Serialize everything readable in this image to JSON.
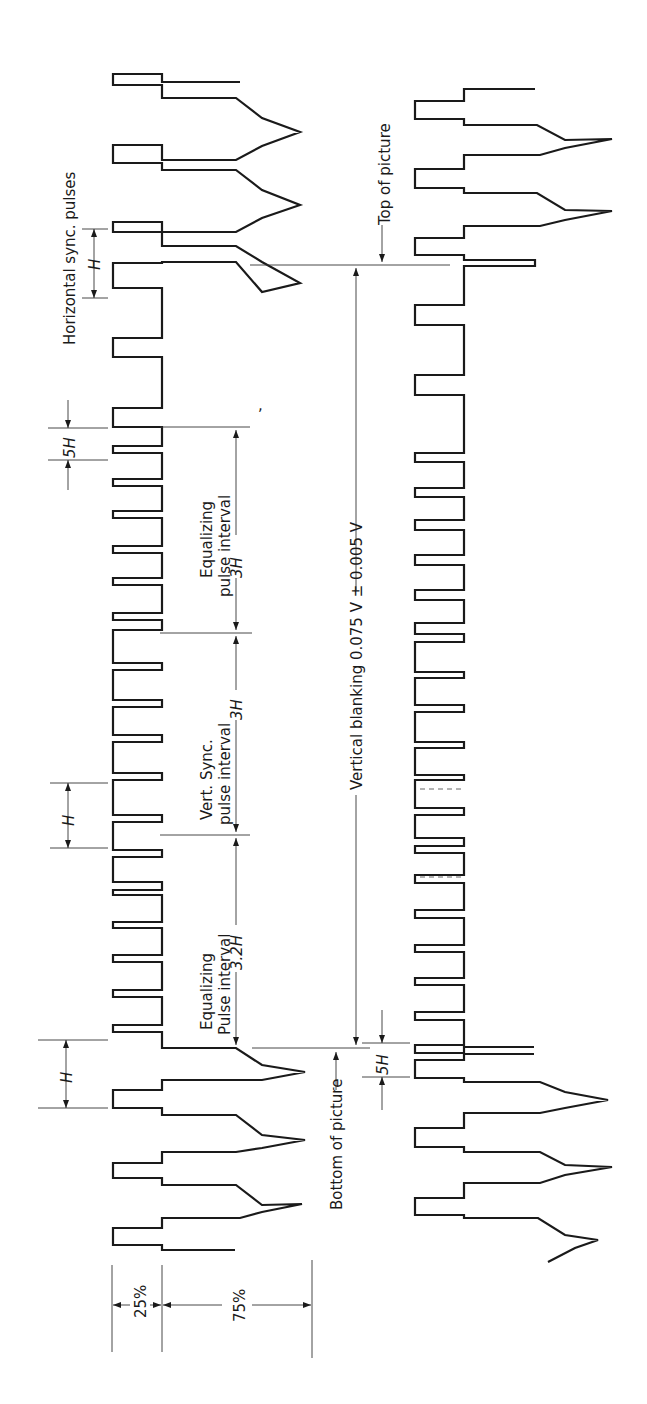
{
  "diagram": {
    "orientation": "rotated 90 degrees counter-clockwise",
    "labels": {
      "horizontal_sync_pulses": "Horizontal  sync. pulses",
      "top_of_picture": "Top of picture",
      "bottom_of_picture": "Bottom of picture",
      "vertical_blanking": "Vertical blanking  0.075 V  ± 0.005 V",
      "equalizing_pulse_interval_top_1": "Equalizing",
      "equalizing_pulse_interval_top_2": "pulse  interval",
      "equalizing_pulse_interval_top_value": "3H",
      "vert_sync_interval_1": "Vert.  Sync.",
      "vert_sync_interval_2": "pulse  interval",
      "vert_sync_interval_value": "3H",
      "equalizing_pulse_interval_bottom_1": "Equalizing",
      "equalizing_pulse_interval_bottom_2": "Pulse  interval",
      "equalizing_pulse_interval_bottom_value": "3.2H",
      "h_dim_1": "H",
      "h_dim_2": "H",
      "h_dim_3": "H",
      "half_h_top": "5H",
      "half_h_bottom": "5H",
      "pct_25": "25%",
      "pct_75": "75%"
    },
    "levels": {
      "sync_tip_pct": 25,
      "picture_pct": 75
    },
    "colors": {
      "stroke": "#1a1a1a",
      "background": "#ffffff"
    }
  }
}
